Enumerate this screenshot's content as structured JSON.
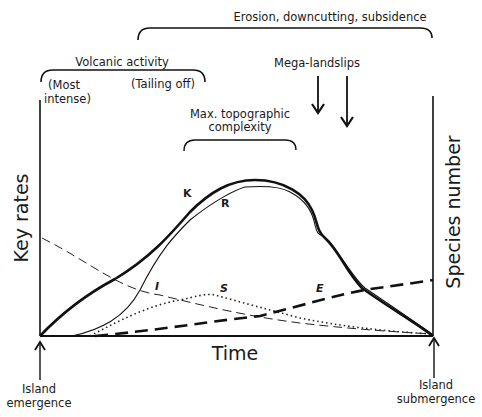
{
  "diagram": {
    "phases": {
      "erosion": "Erosion, downcutting, subsidence",
      "volcanic": "Volcanic activity",
      "volcanic_start": [
        "(Most",
        "intense)"
      ],
      "volcanic_end": "(Tailing off)",
      "mega_landslips": "Mega-landslips",
      "max_topo": [
        "Max. topographic",
        "complexity"
      ]
    },
    "axes": {
      "y_left": "Key rates",
      "y_right": "Species number",
      "x": "Time"
    },
    "events": {
      "start": [
        "Island",
        "emergence"
      ],
      "end": [
        "Island",
        "submergence"
      ]
    },
    "curves": {
      "K": "K",
      "R": "R",
      "I": "I",
      "S": "S",
      "E": "E"
    },
    "curve_legend": [
      {
        "key": "K",
        "style": "thick solid",
        "meaning": "carrying capacity"
      },
      {
        "key": "R",
        "style": "thin solid",
        "meaning": "species richness"
      },
      {
        "key": "I",
        "style": "thin dashed",
        "meaning": "immigration rate"
      },
      {
        "key": "S",
        "style": "dotted",
        "meaning": "speciation rate"
      },
      {
        "key": "E",
        "style": "thick dashed",
        "meaning": "extinction rate"
      }
    ]
  }
}
